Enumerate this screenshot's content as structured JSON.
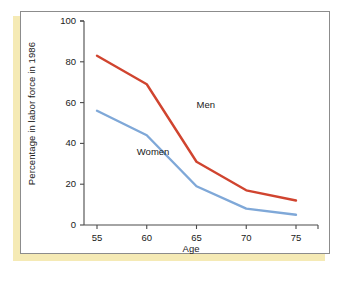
{
  "figure": {
    "frame_border_color": "#8c8c8c",
    "accent_color": "#f5eab5",
    "background_color": "#ffffff"
  },
  "chart_data": {
    "type": "line",
    "title": "",
    "xlabel": "Age",
    "ylabel": "Percentage in labor force in 1986",
    "x": [
      55,
      60,
      65,
      70,
      75
    ],
    "xlim": [
      53,
      77
    ],
    "ylim": [
      0,
      100
    ],
    "xticks": [
      55,
      60,
      65,
      70,
      75
    ],
    "yticks": [
      0,
      20,
      40,
      60,
      80,
      100
    ],
    "xtick_labels": [
      "55",
      "60",
      "65",
      "70",
      "75"
    ],
    "ytick_labels": [
      "0",
      "20",
      "40",
      "60",
      "80",
      "100"
    ],
    "grid": false,
    "legend": "inline-annotations",
    "series": [
      {
        "name": "Men",
        "color": "#d0442f",
        "values": [
          83,
          69,
          31,
          17,
          12
        ],
        "label_x": 65,
        "label_y": 59
      },
      {
        "name": "Women",
        "color": "#7fa8d8",
        "values": [
          56,
          44,
          19,
          8,
          5
        ],
        "label_x": 59,
        "label_y": 36
      }
    ],
    "annotations": [
      {
        "text": "Men",
        "series": "Men"
      },
      {
        "text": "Women",
        "series": "Women"
      }
    ]
  }
}
